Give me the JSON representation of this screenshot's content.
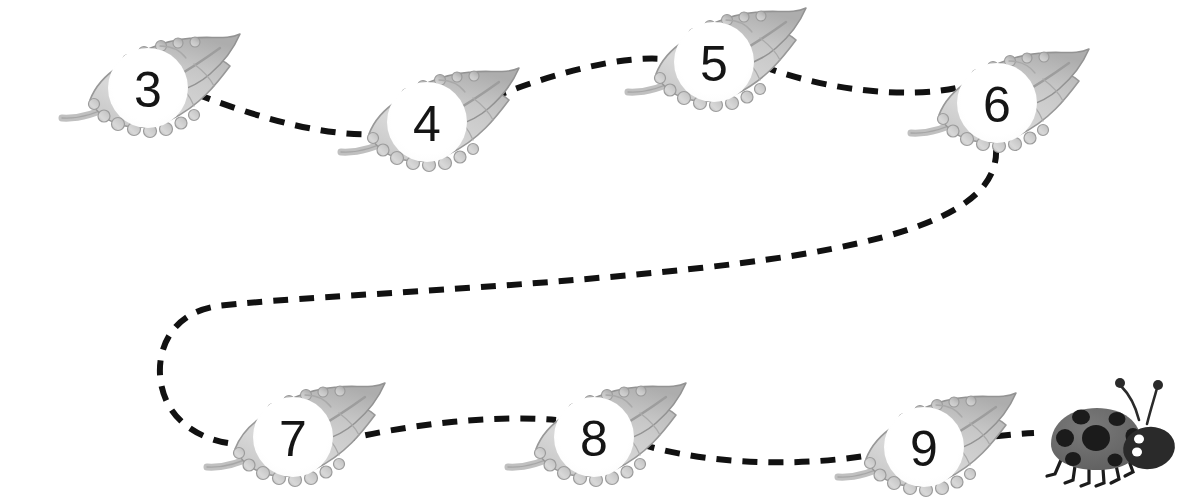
{
  "scene": {
    "title": "Ladybug leaf number path",
    "width": 1191,
    "height": 503,
    "background_color": "#ffffff"
  },
  "style": {
    "path_color": "#111111",
    "path_stroke_width": 6,
    "path_dash": "15 11",
    "leaf_fill": "#d2d2d2",
    "leaf_fill_light": "#e4e4e4",
    "leaf_outline": "#8d8d8d",
    "leaf_vein": "#9a9a9a",
    "leaf_stem": "#bdbdbd",
    "badge_fill": "#ffffff",
    "number_color": "#151515",
    "ladybug_body": "#6a6a6a",
    "ladybug_spot": "#1c1c1c",
    "ladybug_head": "#2a2a2a",
    "ladybug_eye": "#ffffff",
    "ladybug_leg": "#1c1c1c"
  },
  "nodes": [
    {
      "id": "leaf-3",
      "label": "3",
      "cx": 148,
      "cy": 88
    },
    {
      "id": "leaf-4",
      "label": "4",
      "cx": 427,
      "cy": 122
    },
    {
      "id": "leaf-5",
      "label": "5",
      "cx": 714,
      "cy": 62
    },
    {
      "id": "leaf-6",
      "label": "6",
      "cx": 997,
      "cy": 103
    },
    {
      "id": "leaf-7",
      "label": "7",
      "cx": 293,
      "cy": 437
    },
    {
      "id": "leaf-8",
      "label": "8",
      "cx": 594,
      "cy": 437
    },
    {
      "id": "leaf-9",
      "label": "9",
      "cx": 924,
      "cy": 447
    }
  ],
  "ladybug": {
    "id": "ladybug",
    "cx": 1095,
    "cy": 440,
    "spot_count": 7,
    "leg_count": 6,
    "antenna_count": 2
  },
  "path_segments": [
    {
      "id": "segment-3-to-4",
      "from": "leaf-3",
      "to": "leaf-4",
      "d": "M 196 94 C 260 118, 330 140, 392 133"
    },
    {
      "id": "segment-4-to-5",
      "from": "leaf-4",
      "to": "leaf-5",
      "d": "M 468 108 C 530 80, 620 52, 672 60"
    },
    {
      "id": "segment-5-to-6",
      "from": "leaf-5",
      "to": "leaf-6",
      "d": "M 762 66 C 830 92, 910 98, 956 88"
    },
    {
      "id": "segment-6-to-7",
      "from": "leaf-6",
      "to": "leaf-7",
      "d": "M 996 148 C 1000 212, 900 246, 700 268 C 500 290, 300 296, 218 306 C 160 314, 150 370, 168 404 C 186 438, 230 448, 258 443"
    },
    {
      "id": "segment-7-to-8",
      "from": "leaf-7",
      "to": "leaf-8",
      "d": "M 340 441 C 400 426, 490 414, 556 420"
    },
    {
      "id": "segment-8-to-9",
      "from": "leaf-8",
      "to": "leaf-9",
      "d": "M 640 444 C 720 468, 820 466, 886 452"
    },
    {
      "id": "segment-9-to-ladybug",
      "from": "leaf-9",
      "to": "ladybug",
      "d": "M 970 440 C 994 436, 1014 434, 1034 433"
    }
  ]
}
